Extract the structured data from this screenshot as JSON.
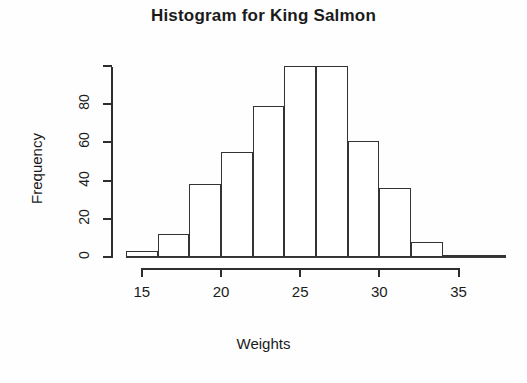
{
  "chart": {
    "title": "Histogram for King Salmon",
    "xlabel": "Weights",
    "ylabel": "Frequency"
  },
  "axes": {
    "y_ticks": [
      {
        "value": 0,
        "label": "0"
      },
      {
        "value": 20,
        "label": "20"
      },
      {
        "value": 40,
        "label": "40"
      },
      {
        "value": 60,
        "label": "60"
      },
      {
        "value": 80,
        "label": "80"
      },
      {
        "value": 100,
        "label": ""
      }
    ],
    "x_ticks": [
      {
        "value": 15,
        "label": "15"
      },
      {
        "value": 20,
        "label": "20"
      },
      {
        "value": 25,
        "label": "25"
      },
      {
        "value": 30,
        "label": "30"
      },
      {
        "value": 35,
        "label": "35"
      }
    ]
  },
  "chart_data": {
    "type": "bar",
    "subtype": "histogram",
    "title": "Histogram for King Salmon",
    "xlabel": "Weights",
    "ylabel": "Frequency",
    "xlim": [
      14,
      38
    ],
    "ylim": [
      0,
      103
    ],
    "grid": false,
    "legend": null,
    "bin_width": 2,
    "bin_edges": [
      14,
      16,
      18,
      20,
      22,
      24,
      26,
      28,
      30,
      32,
      34,
      36,
      38
    ],
    "categories": [
      "14-16",
      "16-18",
      "18-20",
      "20-22",
      "22-24",
      "24-26",
      "26-28",
      "28-30",
      "30-32",
      "32-34",
      "34-36",
      "36-38"
    ],
    "values": [
      3,
      12,
      38,
      55,
      79,
      100,
      100,
      61,
      36,
      8,
      1,
      1
    ],
    "bar_fill": "#ffffff",
    "bar_stroke": "#333333",
    "axis_color": "#2e2e2e",
    "text_color": "#1b1b1b",
    "background": "#fefefe"
  }
}
